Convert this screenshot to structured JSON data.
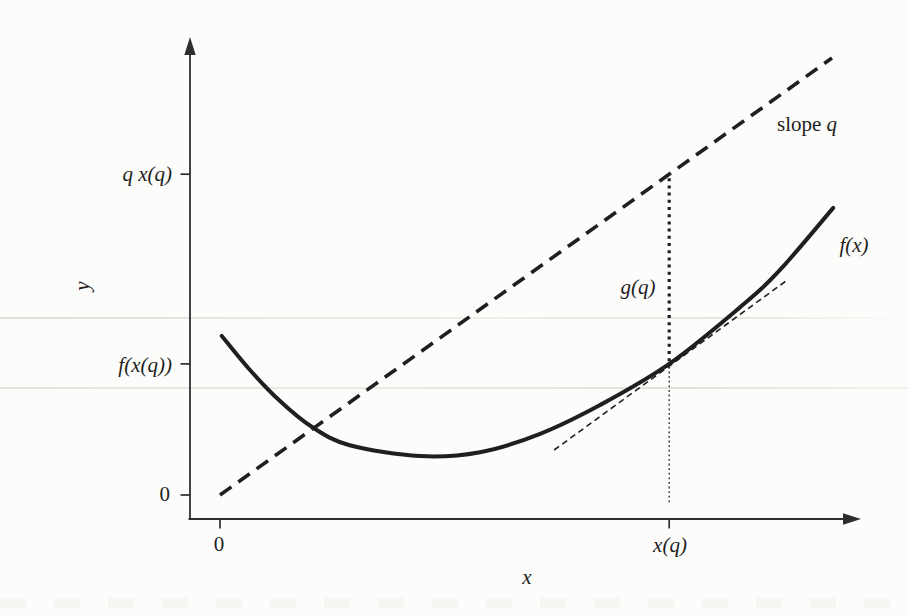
{
  "figure": {
    "background": "#fcfcfa",
    "ink": "#1f1f1f",
    "axis_color": "#2e2e2e",
    "labels": {
      "slope_word": "slope",
      "slope_var": "q",
      "gap_label": "g(q)",
      "curve_label": "f(x)"
    }
  },
  "chart_data": {
    "type": "line",
    "xlabel": "x",
    "ylabel": "y",
    "xlim": [
      0,
      1.08
    ],
    "ylim": [
      0,
      1.1
    ],
    "grid": false,
    "legend": "none",
    "axis_style": "arrowed axes, ticks offset from data origin",
    "series": [
      {
        "name": "f(x) convex curve",
        "style": "solid",
        "points": [
          [
            0.003,
            0.364
          ],
          [
            0.049,
            0.286
          ],
          [
            0.098,
            0.215
          ],
          [
            0.15,
            0.156
          ],
          [
            0.212,
            0.114
          ],
          [
            0.327,
            0.089
          ],
          [
            0.425,
            0.098
          ],
          [
            0.523,
            0.14
          ],
          [
            0.621,
            0.206
          ],
          [
            0.734,
            0.3
          ],
          [
            0.85,
            0.43
          ],
          [
            0.915,
            0.515
          ],
          [
            1.002,
            0.657
          ]
        ]
      },
      {
        "name": "line of slope q through origin",
        "style": "dashed-bold",
        "points": [
          [
            0.0,
            0.0
          ],
          [
            1.0,
            1.0
          ]
        ]
      },
      {
        "name": "tangent to f at x(q) with slope q",
        "style": "dashed-thin",
        "points": [
          [
            0.546,
            0.103
          ],
          [
            0.925,
            0.49
          ]
        ]
      },
      {
        "name": "g(q) vertical gap marker",
        "style": "dotted-bold",
        "points": [
          [
            0.734,
            0.725
          ],
          [
            0.734,
            0.306
          ]
        ]
      },
      {
        "name": "drop line from curve to x-axis at x(q)",
        "style": "dotted-thin",
        "points": [
          [
            0.734,
            0.293
          ],
          [
            0.734,
            -0.021
          ]
        ]
      }
    ],
    "x_ticks": [
      {
        "value": 0,
        "label": "0"
      },
      {
        "value": 0.734,
        "label": "x(q)"
      }
    ],
    "y_ticks": [
      {
        "value": 0,
        "label": "0"
      },
      {
        "value": 0.3,
        "label": "f(x(q))"
      },
      {
        "value": 0.734,
        "label": "q x(q)"
      }
    ],
    "annotations": [
      {
        "text": "slope q",
        "x": 0.96,
        "y": 0.85
      },
      {
        "text": "g(q)",
        "x": 0.683,
        "y": 0.476
      },
      {
        "text": "f(x)",
        "x": 1.036,
        "y": 0.572
      }
    ],
    "derived_quantities": {
      "x_q": 0.734,
      "q_x_q": 0.734,
      "f_x_q": 0.3,
      "g_q": 0.434,
      "slope_q_normalized": 1.0
    }
  }
}
